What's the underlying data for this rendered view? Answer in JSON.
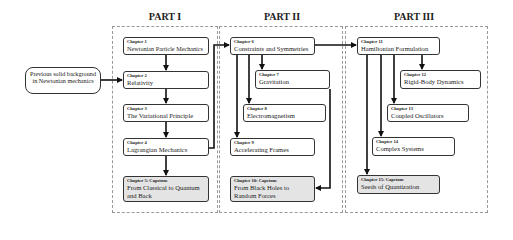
{
  "parts": [
    {
      "title": "PART I"
    },
    {
      "title": "PART II"
    },
    {
      "title": "PART III"
    }
  ],
  "prerequisite": {
    "text": "Previous solid background in Newtonian mechanics"
  },
  "chapters": [
    {
      "label": "Chapter 1",
      "title": "Newtonian Particle Mechanics"
    },
    {
      "label": "Chapter 2",
      "title": "Relativity"
    },
    {
      "label": "Chapter 3",
      "title": "The Variational Principle"
    },
    {
      "label": "Chapter 4",
      "title": "Lagrangian Mechanics"
    },
    {
      "label": "Chapter 5: Capstone",
      "title": "From Classical to Quantum and Back"
    },
    {
      "label": "Chapter 6",
      "title": "Constraints and Symmetries"
    },
    {
      "label": "Chapter 7",
      "title": "Gravitation"
    },
    {
      "label": "Chapter 8",
      "title": "Electromagnetism"
    },
    {
      "label": "Chapter 9",
      "title": "Accelerating Frames"
    },
    {
      "label": "Chapter 10: Capstone",
      "title": "From Black Holes to Random Forces"
    },
    {
      "label": "Chapter 11",
      "title": "Hamiltonian Formulation"
    },
    {
      "label": "Chapter 12",
      "title": "Rigid-Body Dynamics"
    },
    {
      "label": "Chapter 13",
      "title": "Coupled Oscillators"
    },
    {
      "label": "Chapter 14",
      "title": "Complex Systems"
    },
    {
      "label": "Chapter 15: Capstone",
      "title": "Seeds of Quantization"
    }
  ],
  "colors": {
    "line": "#111111",
    "frame": "#999999",
    "capstone_fill": "#e4e4e4"
  }
}
